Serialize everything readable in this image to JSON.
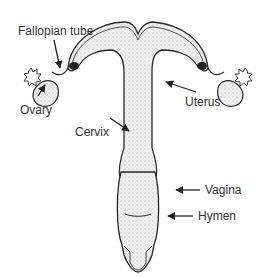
{
  "diagram": {
    "labels": {
      "fallopian_tube": "Fallopian tube",
      "ovary": "Ovary",
      "cervix": "Cervix",
      "uterus": "Uterus",
      "vagina": "Vagina",
      "hymen": "Hymen"
    },
    "colors": {
      "line": "#2a2a2a",
      "fill": "#e6e6e6",
      "text": "#333333",
      "background": "#ffffff"
    }
  }
}
